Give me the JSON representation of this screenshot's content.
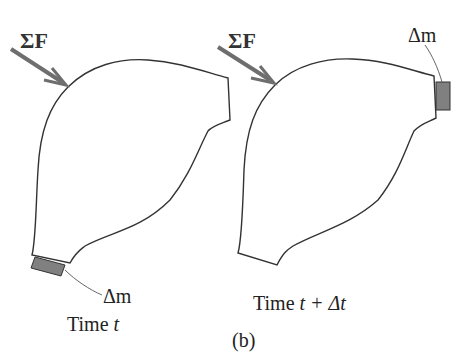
{
  "figure": {
    "caption": "(b)",
    "panels": [
      {
        "id": "left",
        "force_label": "ΣF",
        "mass_label": "Δm",
        "time_label": "Time t",
        "time_prefix": "Time ",
        "time_var": "t",
        "mass_position": "bottom-left exit"
      },
      {
        "id": "right",
        "force_label": "ΣF",
        "mass_label": "Δm",
        "time_label": "Time t + Δt",
        "time_prefix": "Time ",
        "time_var": "t + Δt",
        "mass_position": "top-right inlet"
      }
    ]
  },
  "colors": {
    "outline": "#333333",
    "arrow": "#6e6e6e",
    "mass_fill": "#808080",
    "background": "#ffffff"
  }
}
